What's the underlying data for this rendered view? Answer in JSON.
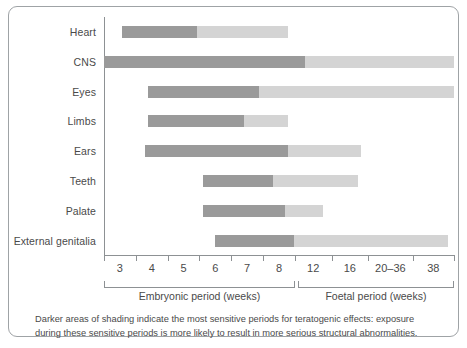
{
  "figure": {
    "caption": "Darker areas of shading indicate the most sensitive periods for teratogenic effects: exposure during these sensitive periods is more likely to result in more serious structural abnormalities."
  },
  "colors": {
    "sensitive_dark": "#9a9a9a",
    "less_sensitive_light": "#d4d4d4",
    "axis": "#8d9194",
    "text": "#4a4a4a",
    "border": "#9fa3a6"
  },
  "axis": {
    "tick_labels": [
      "3",
      "4",
      "5",
      "6",
      "7",
      "8",
      "12",
      "16",
      "20–36",
      "38"
    ],
    "brackets": [
      {
        "label": "Embryonic period (weeks)",
        "start_week": 2.5,
        "end_week": 8.5
      },
      {
        "label": "Foetal period (weeks)",
        "start_week": 8.5,
        "end_week": 14.5
      }
    ]
  },
  "chart_data": {
    "type": "bar",
    "xlabel": "Weeks of gestation",
    "ylabel": "",
    "grid": false,
    "legend": [
      "Most sensitive period (darker shading)",
      "Less sensitive period (lighter shading)"
    ],
    "x_tick_labels": [
      "3",
      "4",
      "5",
      "6",
      "7",
      "8",
      "12",
      "16",
      "20–36",
      "38"
    ],
    "x_slot_range": [
      2.5,
      14.5
    ],
    "categories": [
      "Heart",
      "CNS",
      "Eyes",
      "Limbs",
      "Ears",
      "Teeth",
      "Palate",
      "External genitalia"
    ],
    "series": [
      {
        "name": "Most sensitive (dark)",
        "color": "#9a9a9a",
        "spans": [
          {
            "category": "Heart",
            "start": 3.1,
            "end": 5.7
          },
          {
            "category": "CNS",
            "start": 2.5,
            "end": 9.4
          },
          {
            "category": "Eyes",
            "start": 4.0,
            "end": 7.8
          },
          {
            "category": "Limbs",
            "start": 4.0,
            "end": 7.3
          },
          {
            "category": "Ears",
            "start": 3.9,
            "end": 8.8
          },
          {
            "category": "Teeth",
            "start": 5.9,
            "end": 8.3
          },
          {
            "category": "Palate",
            "start": 5.9,
            "end": 8.7
          },
          {
            "category": "External genitalia",
            "start": 6.3,
            "end": 9.0
          }
        ]
      },
      {
        "name": "Less sensitive (light)",
        "color": "#d4d4d4",
        "spans": [
          {
            "category": "Heart",
            "start": 5.7,
            "end": 8.8
          },
          {
            "category": "CNS",
            "start": 9.4,
            "end": 14.5
          },
          {
            "category": "Eyes",
            "start": 7.8,
            "end": 14.5
          },
          {
            "category": "Limbs",
            "start": 7.3,
            "end": 8.8
          },
          {
            "category": "Ears",
            "start": 8.8,
            "end": 11.3
          },
          {
            "category": "Teeth",
            "start": 8.3,
            "end": 11.2
          },
          {
            "category": "Palate",
            "start": 8.7,
            "end": 10.0
          },
          {
            "category": "External genitalia",
            "start": 9.0,
            "end": 14.3
          }
        ]
      }
    ]
  },
  "rows": [
    {
      "label": "Heart",
      "dark": [
        3.1,
        5.7
      ],
      "light": [
        5.7,
        8.8
      ]
    },
    {
      "label": "CNS",
      "dark": [
        2.5,
        9.4
      ],
      "light": [
        9.4,
        14.5
      ]
    },
    {
      "label": "Eyes",
      "dark": [
        4.0,
        7.8
      ],
      "light": [
        7.8,
        14.5
      ]
    },
    {
      "label": "Limbs",
      "dark": [
        4.0,
        7.3
      ],
      "light": [
        7.3,
        8.8
      ]
    },
    {
      "label": "Ears",
      "dark": [
        3.9,
        8.8
      ],
      "light": [
        8.8,
        11.3
      ]
    },
    {
      "label": "Teeth",
      "dark": [
        5.9,
        8.3
      ],
      "light": [
        8.3,
        11.2
      ]
    },
    {
      "label": "Palate",
      "dark": [
        5.9,
        8.7
      ],
      "light": [
        8.7,
        10.0
      ]
    },
    {
      "label": "External genitalia",
      "dark": [
        6.3,
        9.0
      ],
      "light": [
        9.0,
        14.3
      ]
    }
  ]
}
